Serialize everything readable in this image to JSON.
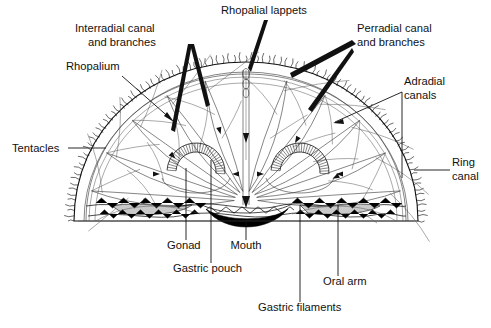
{
  "figure": {
    "background_color": "#ffffff",
    "ink_color": "#111111",
    "width": 491,
    "height": 328
  },
  "labels": [
    {
      "id": "rhopalial-lappets",
      "text": "Rhopalial lappets",
      "x": 221,
      "y": 14,
      "anchor": "start",
      "leader_type": "wedge-arrow",
      "points_to": "bell apex notch"
    },
    {
      "id": "interradial-canal",
      "text_line1": "Interradial canal",
      "text_line2": "and branches",
      "x": 75,
      "y": 32,
      "anchor": "start",
      "leader_type": "wedge-arrow",
      "points_to": "interradial canals in bell"
    },
    {
      "id": "rhopalium",
      "text": "Rhopalium",
      "x": 66,
      "y": 70,
      "anchor": "start",
      "leader_type": "line-arrow",
      "points_to": "bell margin sense organ"
    },
    {
      "id": "perradial-canal",
      "text_line1": "Perradial canal",
      "text_line2": "and branches",
      "x": 357,
      "y": 32,
      "anchor": "start",
      "leader_type": "wedge-arrow",
      "points_to": "perradial canals in bell"
    },
    {
      "id": "adradial-canals",
      "text_line1": "Adradial",
      "text_line2": "canals",
      "x": 404,
      "y": 85,
      "anchor": "start",
      "leader_type": "bracket",
      "points_to": "adradial canal group"
    },
    {
      "id": "tentacles",
      "text": "Tentacles",
      "x": 12,
      "y": 152,
      "anchor": "start",
      "leader_type": "horizontal-line",
      "points_to": "bell margin tentacle fringe"
    },
    {
      "id": "ring-canal",
      "text_line1": "Ring",
      "text_line2": "canal",
      "x": 452,
      "y": 166,
      "anchor": "start",
      "leader_type": "horizontal-line",
      "points_to": "circular canal at bell rim"
    },
    {
      "id": "gonad",
      "text": "Gonad",
      "x": 167,
      "y": 249,
      "anchor": "start",
      "leader_type": "vertical-line",
      "points_to": "horseshoe gonad"
    },
    {
      "id": "mouth",
      "text": "Mouth",
      "x": 246,
      "y": 249,
      "anchor": "middle",
      "leader_type": "vertical-line",
      "points_to": "central mouth opening"
    },
    {
      "id": "gastric-pouch",
      "text": "Gastric pouch",
      "x": 173,
      "y": 272,
      "anchor": "start",
      "leader_type": "vertical-line",
      "points_to": "gastric pouch cavity"
    },
    {
      "id": "oral-arm",
      "text": "Oral arm",
      "x": 323,
      "y": 285,
      "anchor": "start",
      "leader_type": "vertical-line",
      "points_to": "oral arm"
    },
    {
      "id": "gastric-filaments",
      "text": "Gastric filaments",
      "x": 258,
      "y": 311,
      "anchor": "start",
      "leader_type": "vertical-line",
      "points_to": "gastric filaments"
    }
  ],
  "structures": {
    "bell": "semicircular medusa bell shown in cutaway",
    "tentacle_fringe": "dense marginal tentacles around bell rim",
    "gonads": "two horseshoe-shaped gonads flanking the center",
    "mouth": "solid black crescent at the oral center",
    "manubrium": "central vertical canal from apex to mouth"
  }
}
